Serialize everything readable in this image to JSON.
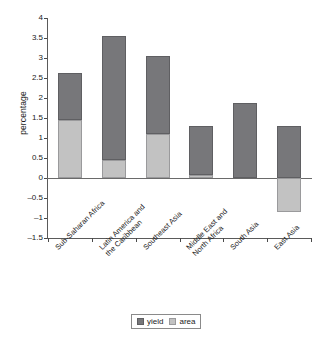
{
  "chart_data": {
    "type": "bar",
    "title": "",
    "subtitle": "",
    "xlabel": "",
    "ylabel": "percentage",
    "ylim": [
      -1.5,
      4
    ],
    "ytick_values": [
      -1.5,
      -1,
      -0.5,
      0,
      0.5,
      1,
      1.5,
      2,
      2.5,
      3,
      3.5,
      4
    ],
    "ytick_labels": [
      "–1.5",
      "–1",
      "–0.5",
      "0",
      "0.5",
      "1",
      "1.5",
      "2",
      "2.5",
      "3",
      "3.5",
      "4"
    ],
    "grid": false,
    "stacked": true,
    "legend_position": "bottom",
    "categories": [
      "Sub-Saharan Africa",
      "Latin America and\nthe Caribbean",
      "Southeast Asia",
      "Middle East and\nNorth Africa",
      "South Asia",
      "East Asia"
    ],
    "series": [
      {
        "name": "area",
        "color": "#c2c2c2",
        "values": [
          1.45,
          0.45,
          1.1,
          0.08,
          0.0,
          -0.85
        ]
      },
      {
        "name": "yield",
        "color": "#77777a",
        "values": [
          1.17,
          3.1,
          1.95,
          1.22,
          1.87,
          1.3
        ]
      }
    ],
    "totals_positive": [
      2.62,
      3.55,
      3.05,
      1.3,
      1.87,
      1.3
    ],
    "annotations": []
  },
  "legend": {
    "items": [
      {
        "label": "yield",
        "color": "#77777a",
        "swatch": "yield"
      },
      {
        "label": "area",
        "color": "#c2c2c2",
        "swatch": "area"
      }
    ]
  },
  "axis": {
    "y_title": "percentage"
  }
}
